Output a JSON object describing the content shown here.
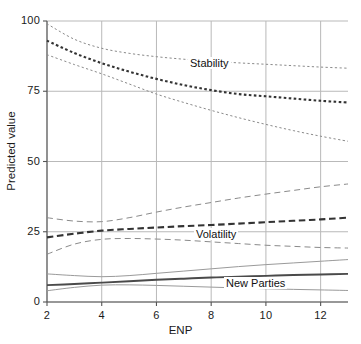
{
  "chart_data": {
    "type": "line",
    "title": "",
    "xlabel": "ENP",
    "ylabel": "Predicted value",
    "xlim": [
      2,
      13
    ],
    "ylim": [
      0,
      100
    ],
    "xticks": [
      2,
      4,
      6,
      8,
      10,
      12
    ],
    "yticks": [
      0,
      25,
      50,
      75,
      100
    ],
    "grid": true,
    "legend_position": "inline-annotations",
    "annotations": [
      {
        "text": "Stability",
        "x": 7.2,
        "y": 88
      },
      {
        "text": "Volatility",
        "x": 7.4,
        "y": 22
      },
      {
        "text": "New Parties",
        "x": 8.6,
        "y": 7.5
      }
    ],
    "x": [
      2,
      3,
      4,
      5,
      6,
      7,
      8,
      9,
      10,
      11,
      12,
      13
    ],
    "series": [
      {
        "name": "Stability",
        "style": "dotted-bold",
        "color": "#333333",
        "values": [
          93.0,
          88.6,
          85.0,
          82.0,
          79.4,
          77.2,
          75.4,
          74.0,
          73.2,
          72.4,
          71.6,
          71.0
        ]
      },
      {
        "name": "Stability upper CI",
        "style": "dotted-thin",
        "color": "#8a8a8a",
        "values": [
          99.0,
          93.5,
          90.3,
          88.5,
          87.3,
          86.4,
          85.7,
          85.1,
          84.6,
          84.1,
          83.6,
          83.2
        ]
      },
      {
        "name": "Stability lower CI",
        "style": "dotted-thin",
        "color": "#8a8a8a",
        "values": [
          88.0,
          84.5,
          81.2,
          77.6,
          74.0,
          71.0,
          68.2,
          65.6,
          63.2,
          61.0,
          59.0,
          57.2
        ]
      },
      {
        "name": "Volatility",
        "style": "dashed-bold",
        "color": "#333333",
        "values": [
          23.0,
          24.3,
          25.4,
          26.0,
          26.5,
          27.0,
          27.4,
          27.9,
          28.4,
          28.9,
          29.4,
          30.0
        ]
      },
      {
        "name": "Volatility upper CI",
        "style": "dashed-thin",
        "color": "#8a8a8a",
        "values": [
          30.0,
          28.8,
          28.6,
          30.0,
          32.0,
          33.8,
          35.4,
          37.0,
          38.4,
          39.7,
          41.0,
          42.0
        ]
      },
      {
        "name": "Volatility lower CI",
        "style": "dashed-thin",
        "color": "#8a8a8a",
        "values": [
          17.0,
          20.6,
          22.3,
          22.6,
          22.4,
          22.0,
          21.4,
          20.8,
          20.2,
          19.8,
          19.4,
          19.2
        ]
      },
      {
        "name": "New Parties",
        "style": "solid-bold",
        "color": "#4a4a4a",
        "values": [
          6.0,
          6.4,
          6.9,
          7.4,
          7.9,
          8.3,
          8.7,
          9.0,
          9.3,
          9.6,
          9.8,
          10.0
        ]
      },
      {
        "name": "New Parties upper CI",
        "style": "solid-thin",
        "color": "#9a9a9a",
        "values": [
          10.0,
          9.4,
          9.0,
          9.4,
          10.2,
          11.0,
          11.8,
          12.6,
          13.3,
          13.9,
          14.5,
          15.1
        ]
      },
      {
        "name": "New Parties lower CI",
        "style": "solid-thin",
        "color": "#9a9a9a",
        "values": [
          4.0,
          5.2,
          6.0,
          6.1,
          5.9,
          5.6,
          5.3,
          5.0,
          4.7,
          4.5,
          4.3,
          4.1
        ]
      }
    ]
  },
  "axis": {
    "ylabel": "Predicted value",
    "xlabel": "ENP",
    "ytick_labels": [
      "0",
      "25",
      "50",
      "75",
      "100"
    ],
    "xtick_labels": [
      "2",
      "4",
      "6",
      "8",
      "10",
      "12"
    ]
  },
  "labels": {
    "stability": "Stability",
    "volatility": "Volatility",
    "new_parties": "New Parties"
  }
}
